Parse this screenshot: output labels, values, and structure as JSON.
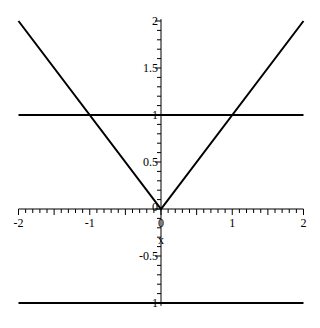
{
  "chart_data": {
    "type": "line",
    "title": "",
    "xlabel": "x",
    "ylabel": "",
    "xlim": [
      -2,
      2
    ],
    "ylim": [
      -1.1,
      2.05
    ],
    "grid": false,
    "legend": null,
    "x_ticks": [
      "-2",
      "-1",
      "0",
      "1",
      "2"
    ],
    "y_ticks": [
      "-1",
      "-0.5",
      "0",
      "0.5",
      "1",
      "1.5",
      "2"
    ],
    "series": [
      {
        "name": "|x|",
        "x": [
          -2,
          0,
          2
        ],
        "y": [
          2,
          0,
          2
        ]
      },
      {
        "name": "y=1",
        "x": [
          -2,
          2
        ],
        "y": [
          1,
          1
        ]
      },
      {
        "name": "y=-1",
        "x": [
          -2,
          2
        ],
        "y": [
          -1,
          -1
        ]
      }
    ]
  },
  "labels": {
    "x_axis": "x",
    "x_ticks": [
      {
        "v": -2,
        "t": "-2"
      },
      {
        "v": -1,
        "t": "-1"
      },
      {
        "v": 0,
        "t": "0"
      },
      {
        "v": 1,
        "t": "1"
      },
      {
        "v": 2,
        "t": "2"
      }
    ],
    "y_ticks": [
      {
        "v": -1,
        "t": "-1"
      },
      {
        "v": -0.5,
        "t": "-0.5"
      },
      {
        "v": 0,
        "t": "0"
      },
      {
        "v": 0.5,
        "t": "0.5"
      },
      {
        "v": 1,
        "t": "1"
      },
      {
        "v": 1.5,
        "t": "1.5"
      },
      {
        "v": 2,
        "t": "2"
      }
    ]
  }
}
